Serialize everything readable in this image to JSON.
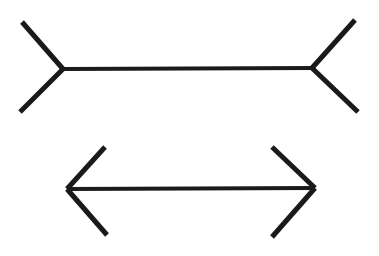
{
  "canvas": {
    "width": 379,
    "height": 256,
    "background_color": "#ffffff",
    "stroke_color": "#1a1a1a",
    "shaft_width": 4.2,
    "fin_width": 5.0
  },
  "figure": {
    "name": "Muller-Lyer illusion",
    "description": "Two horizontal line segments of equal length; the upper has outward-pointing fins, the lower has inward-pointing arrowheads.",
    "element_count": 10
  },
  "shapes": {
    "top_figure": {
      "name": "outward-fins-figure",
      "shaft": {
        "x1": 63,
        "y1": 69,
        "x2": 312,
        "y2": 68,
        "length_px": 249
      },
      "fins": [
        {
          "name": "top-left-fin",
          "x1": 63,
          "y1": 69,
          "x2": 22,
          "y2": 22
        },
        {
          "name": "bottom-left-fin",
          "x1": 63,
          "y1": 69,
          "x2": 20,
          "y2": 112
        },
        {
          "name": "top-right-fin",
          "x1": 312,
          "y1": 68,
          "x2": 355,
          "y2": 20
        },
        {
          "name": "bottom-right-fin",
          "x1": 312,
          "y1": 68,
          "x2": 358,
          "y2": 112
        }
      ]
    },
    "bottom_figure": {
      "name": "inward-arrowheads-figure",
      "shaft": {
        "x1": 67,
        "y1": 189,
        "x2": 315,
        "y2": 188,
        "length_px": 248
      },
      "fins": [
        {
          "name": "top-left-arrowhead",
          "x1": 67,
          "y1": 189,
          "x2": 105,
          "y2": 147
        },
        {
          "name": "bottom-left-arrowhead",
          "x1": 67,
          "y1": 189,
          "x2": 107,
          "y2": 235
        },
        {
          "name": "top-right-arrowhead",
          "x1": 315,
          "y1": 188,
          "x2": 272,
          "y2": 147
        },
        {
          "name": "bottom-right-arrowhead",
          "x1": 315,
          "y1": 188,
          "x2": 272,
          "y2": 237
        }
      ]
    }
  },
  "chart_data": {
    "type": "line",
    "title": "",
    "xlabel": "",
    "ylabel": "",
    "series": [
      {
        "name": "Upper shaft (fins out)",
        "x": [
          63,
          312
        ],
        "y": [
          69,
          68
        ]
      },
      {
        "name": "Lower shaft (fins in)",
        "x": [
          67,
          315
        ],
        "y": [
          189,
          188
        ]
      }
    ]
  }
}
